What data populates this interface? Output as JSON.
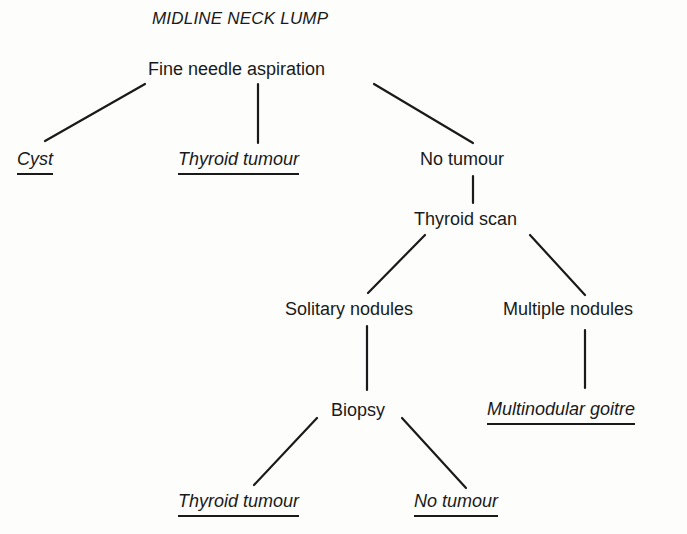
{
  "title": "MIDLINE NECK LUMP",
  "nodes": {
    "fna": "Fine needle aspiration",
    "cyst": "Cyst",
    "thyroid_tumour_1": "Thyroid tumour",
    "no_tumour_1": "No tumour",
    "thyroid_scan": "Thyroid scan",
    "solitary_nodules": "Solitary nodules",
    "multiple_nodules": "Multiple nodules",
    "biopsy": "Biopsy",
    "multinodular_goitre": "Multinodular goitre",
    "thyroid_tumour_2": "Thyroid tumour",
    "no_tumour_2": "No tumour"
  },
  "edges": [
    {
      "from": "fna",
      "to": "cyst"
    },
    {
      "from": "fna",
      "to": "thyroid_tumour_1"
    },
    {
      "from": "fna",
      "to": "no_tumour_1"
    },
    {
      "from": "no_tumour_1",
      "to": "thyroid_scan"
    },
    {
      "from": "thyroid_scan",
      "to": "solitary_nodules"
    },
    {
      "from": "thyroid_scan",
      "to": "multiple_nodules"
    },
    {
      "from": "solitary_nodules",
      "to": "biopsy"
    },
    {
      "from": "multiple_nodules",
      "to": "multinodular_goitre"
    },
    {
      "from": "biopsy",
      "to": "thyroid_tumour_2"
    },
    {
      "from": "biopsy",
      "to": "no_tumour_2"
    }
  ],
  "outcomes": [
    "cyst",
    "thyroid_tumour_1",
    "multinodular_goitre",
    "thyroid_tumour_2",
    "no_tumour_2"
  ],
  "colors": {
    "ink": "#1a1a1a",
    "paper": "#fdfdfc"
  }
}
